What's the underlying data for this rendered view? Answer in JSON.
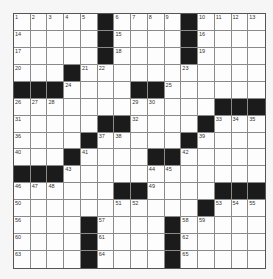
{
  "puzzle": {
    "rows": 15,
    "cols": 15,
    "colors": {
      "black_square": "#1b1b1b",
      "white_square": "#fdfdfd",
      "grid_line": "#8a8a8a",
      "background": "#f6f6f6"
    },
    "layout": [
      ".....#....#....",
      ".....#....#....",
      ".....#....#....",
      "...#...........",
      "###....##......",
      "............###",
      ".....##....#...",
      "....#.....#....",
      "...#....##.....",
      "###............",
      "......##....###",
      "...........#...",
      "....#....#.....",
      "....#....#.....",
      "....#....#....."
    ],
    "numbers": [
      [
        1,
        2,
        3,
        4,
        5,
        null,
        6,
        7,
        8,
        9,
        null,
        10,
        11,
        12,
        13
      ],
      [
        14,
        null,
        null,
        null,
        null,
        null,
        15,
        null,
        null,
        null,
        null,
        16,
        null,
        null,
        null
      ],
      [
        17,
        null,
        null,
        null,
        null,
        null,
        18,
        null,
        null,
        null,
        null,
        19,
        null,
        null,
        null
      ],
      [
        20,
        null,
        null,
        null,
        21,
        22,
        null,
        null,
        null,
        null,
        23,
        null,
        null,
        null,
        null
      ],
      [
        null,
        null,
        null,
        24,
        null,
        null,
        null,
        null,
        null,
        25,
        null,
        null,
        null,
        null,
        null
      ],
      [
        26,
        27,
        28,
        null,
        null,
        null,
        null,
        29,
        30,
        null,
        null,
        null,
        null,
        null,
        null
      ],
      [
        31,
        null,
        null,
        null,
        null,
        null,
        null,
        32,
        null,
        null,
        null,
        null,
        33,
        34,
        35
      ],
      [
        36,
        null,
        null,
        null,
        null,
        37,
        38,
        null,
        null,
        null,
        null,
        39,
        null,
        null,
        null
      ],
      [
        40,
        null,
        null,
        null,
        41,
        null,
        null,
        null,
        null,
        null,
        42,
        null,
        null,
        null,
        null
      ],
      [
        null,
        null,
        null,
        43,
        null,
        null,
        null,
        null,
        44,
        45,
        null,
        null,
        null,
        null,
        null
      ],
      [
        46,
        47,
        48,
        null,
        null,
        null,
        null,
        null,
        49,
        null,
        null,
        null,
        null,
        null,
        null
      ],
      [
        50,
        null,
        null,
        null,
        null,
        null,
        51,
        52,
        null,
        null,
        null,
        null,
        53,
        54,
        55
      ],
      [
        56,
        null,
        null,
        null,
        null,
        57,
        null,
        null,
        null,
        null,
        58,
        59,
        null,
        null,
        null
      ],
      [
        60,
        null,
        null,
        null,
        null,
        61,
        null,
        null,
        null,
        null,
        62,
        null,
        null,
        null,
        null
      ],
      [
        63,
        null,
        null,
        null,
        null,
        64,
        null,
        null,
        null,
        null,
        65,
        null,
        null,
        null,
        null
      ]
    ]
  }
}
